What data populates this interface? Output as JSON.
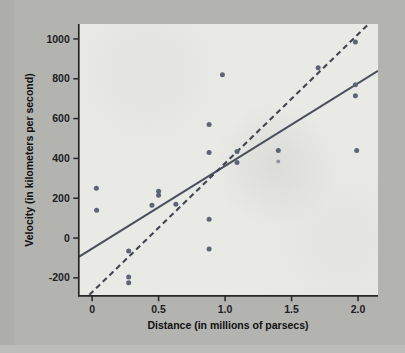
{
  "figure": {
    "name": "hubble-velocity-distance-scatter",
    "background_color": "#b3b3b0",
    "plot_background_color": "#e9e9e6"
  },
  "chart_data": {
    "type": "scatter",
    "title": "",
    "xlabel": "Distance (in millions of parsecs)",
    "ylabel": "Velocity (in kilometers per second)",
    "xlim": [
      -0.1,
      2.15
    ],
    "ylim": [
      -290,
      1075
    ],
    "xticks": [
      0,
      0.5,
      1.0,
      1.5,
      2.0
    ],
    "xtick_labels": [
      "0",
      "0.5",
      "1.0",
      "1.5",
      "2.0"
    ],
    "yticks": [
      -200,
      0,
      200,
      400,
      600,
      800,
      1000
    ],
    "ytick_labels": [
      "-200",
      "0",
      "200",
      "400",
      "600",
      "800",
      "1000"
    ],
    "grid": false,
    "legend": null,
    "point_color": "#5d6475",
    "points": [
      {
        "x": 0.032,
        "y": 250
      },
      {
        "x": 0.034,
        "y": 140
      },
      {
        "x": 0.275,
        "y": -65
      },
      {
        "x": 0.275,
        "y": -195
      },
      {
        "x": 0.275,
        "y": -225
      },
      {
        "x": 0.45,
        "y": 165
      },
      {
        "x": 0.5,
        "y": 235
      },
      {
        "x": 0.5,
        "y": 215
      },
      {
        "x": 0.63,
        "y": 170
      },
      {
        "x": 0.88,
        "y": 570
      },
      {
        "x": 0.88,
        "y": 430
      },
      {
        "x": 0.88,
        "y": 95
      },
      {
        "x": 0.88,
        "y": -55
      },
      {
        "x": 0.98,
        "y": 820
      },
      {
        "x": 1.09,
        "y": 435
      },
      {
        "x": 1.09,
        "y": 380
      },
      {
        "x": 1.4,
        "y": 440
      },
      {
        "x": 1.4,
        "y": 385,
        "faint": true
      },
      {
        "x": 1.7,
        "y": 855
      },
      {
        "x": 1.98,
        "y": 985
      },
      {
        "x": 1.98,
        "y": 770
      },
      {
        "x": 1.98,
        "y": 715
      },
      {
        "x": 1.99,
        "y": 440
      }
    ],
    "lines": [
      {
        "name": "solid-fit-line",
        "style": "solid",
        "color": "#4a4f5c",
        "x0": -0.1,
        "y0": -95,
        "x1": 2.15,
        "y1": 840
      },
      {
        "name": "dashed-fit-line",
        "style": "dashed",
        "color": "#41454f",
        "x0": -0.02,
        "y0": -285,
        "x1": 2.08,
        "y1": 1075
      }
    ]
  },
  "axes": {
    "x_axis_name": "x-axis",
    "y_axis_name": "y-axis"
  }
}
